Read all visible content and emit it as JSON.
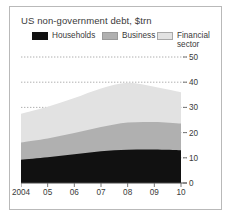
{
  "card": {
    "title": "US non-government debt, $trn"
  },
  "legend": {
    "items": [
      {
        "label": "Households",
        "color": "#111111",
        "key": "households"
      },
      {
        "label": "Business",
        "color": "#b0b0b0",
        "key": "business"
      },
      {
        "label": "Financial sector",
        "color": "#e2e2e2",
        "key": "financial"
      }
    ]
  },
  "chart_data": {
    "type": "area",
    "stacked": true,
    "title": "US non-government debt, $trn",
    "xlabel": "",
    "ylabel": "",
    "unit": "$trn",
    "grid": true,
    "grid_style": "dotted-horizontal",
    "y_axis_position": "right",
    "ylim": [
      0,
      50
    ],
    "yticks": [
      0,
      10,
      20,
      30,
      40,
      50
    ],
    "ytick_labels": [
      "0",
      "10",
      "20",
      "30",
      "40",
      "50"
    ],
    "x": [
      2004,
      2005,
      2006,
      2007,
      2008,
      2009,
      2010
    ],
    "categories": [
      "2004",
      "05",
      "06",
      "07",
      "08",
      "09",
      "10"
    ],
    "legend_position": "top",
    "series": [
      {
        "name": "Households",
        "color": "#111111",
        "values": [
          9.2,
          10.2,
          11.4,
          12.6,
          13.2,
          13.3,
          13.0
        ]
      },
      {
        "name": "Business",
        "color": "#b0b0b0",
        "values": [
          6.9,
          7.5,
          8.4,
          9.6,
          10.8,
          10.9,
          10.6
        ]
      },
      {
        "name": "Financial sector",
        "color": "#e2e2e2",
        "values": [
          11.4,
          12.6,
          13.9,
          15.3,
          15.8,
          14.0,
          12.4
        ]
      }
    ],
    "cumulative_tops": {
      "households": [
        9.2,
        10.2,
        11.4,
        12.6,
        13.2,
        13.3,
        13.0
      ],
      "business": [
        16.1,
        17.7,
        19.8,
        22.2,
        24.0,
        24.2,
        23.6
      ],
      "financial": [
        27.5,
        30.3,
        33.7,
        37.5,
        39.8,
        38.2,
        36.0
      ]
    }
  }
}
